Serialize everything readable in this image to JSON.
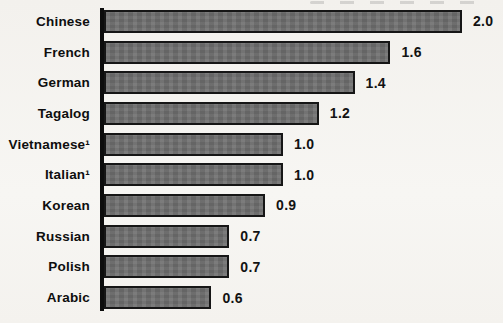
{
  "chart_data": {
    "type": "bar",
    "orientation": "horizontal",
    "categories": [
      "Chinese",
      "French",
      "German",
      "Tagalog",
      "Vietnamese¹",
      "Italian¹",
      "Korean",
      "Russian",
      "Polish",
      "Arabic"
    ],
    "values": [
      2.0,
      1.6,
      1.4,
      1.2,
      1.0,
      1.0,
      0.9,
      0.7,
      0.7,
      0.6
    ],
    "value_labels": [
      "2.0",
      "1.6",
      "1.4",
      "1.2",
      "1.0",
      "1.0",
      "0.9",
      "0.7",
      "0.7",
      "0.6"
    ],
    "xlim": [
      0,
      2.0
    ],
    "grid": false,
    "legend": false,
    "bar_color": "#6f6f6f",
    "bar_border_color": "#161616",
    "axis_color": "#0d0d0d",
    "background_color": "#f5f3ef",
    "label_color": "#0e0e0e"
  }
}
